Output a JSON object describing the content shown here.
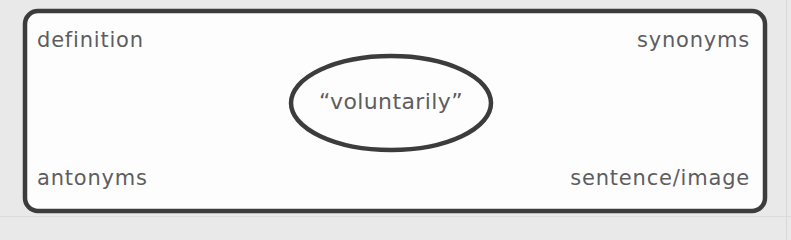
{
  "document": {
    "type": "four-square-vocabulary-graphic-organizer",
    "background_color": "#e9e9ea",
    "ink_color": "#3c3c3e",
    "text_color": "#5d5d5f"
  },
  "center": {
    "term": "“voluntarily”",
    "shape": "ellipse"
  },
  "quadrants": {
    "top_left": {
      "label": "definition"
    },
    "top_right": {
      "label": "synonyms"
    },
    "bottom_left": {
      "label": "antonyms"
    },
    "bottom_right": {
      "label": "sentence/image"
    }
  }
}
